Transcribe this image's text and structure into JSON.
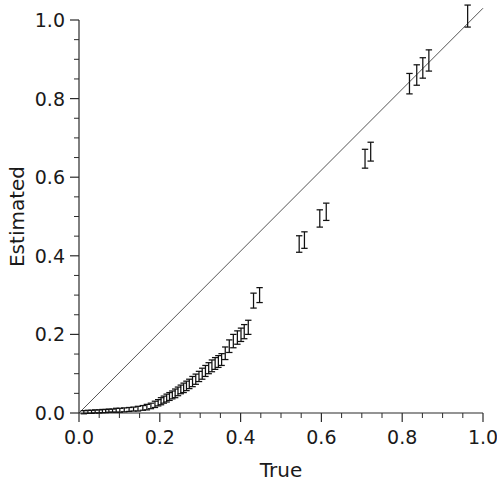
{
  "chart_data": {
    "type": "scatter",
    "title": "",
    "xlabel": "True",
    "ylabel": "Estimated",
    "xlim": [
      0.0,
      1.0
    ],
    "ylim": [
      0.0,
      1.0
    ],
    "grid": false,
    "legend": null,
    "xticks": [
      0.0,
      0.2,
      0.4,
      0.6,
      0.8,
      1.0
    ],
    "yticks": [
      0.0,
      0.2,
      0.4,
      0.6,
      0.8,
      1.0
    ],
    "xticklabels": [
      "0.0",
      "0.2",
      "0.4",
      "0.6",
      "0.8",
      "1.0"
    ],
    "yticklabels": [
      "0.0",
      "0.2",
      "0.4",
      "0.6",
      "0.8",
      "1.0"
    ],
    "minor_tick_step": 0.05,
    "reference_line": {
      "name": "identity-line",
      "from": [
        0.0,
        0.0
      ],
      "to": [
        1.0,
        1.03
      ],
      "color": "#555555"
    },
    "marker_style": "vertical-error-bar-with-caps",
    "marker_color": "#111111",
    "series": [
      {
        "name": "estimated-vs-true",
        "x": [
          0.012,
          0.022,
          0.031,
          0.04,
          0.05,
          0.058,
          0.066,
          0.074,
          0.083,
          0.092,
          0.101,
          0.112,
          0.124,
          0.135,
          0.146,
          0.158,
          0.168,
          0.178,
          0.188,
          0.196,
          0.203,
          0.21,
          0.217,
          0.224,
          0.231,
          0.238,
          0.245,
          0.252,
          0.259,
          0.266,
          0.273,
          0.281,
          0.289,
          0.297,
          0.305,
          0.313,
          0.321,
          0.329,
          0.337,
          0.345,
          0.353,
          0.362,
          0.372,
          0.382,
          0.392,
          0.401,
          0.409,
          0.419,
          0.432,
          0.447,
          0.545,
          0.558,
          0.596,
          0.612,
          0.708,
          0.722,
          0.818,
          0.836,
          0.851,
          0.866,
          0.962
        ],
        "y": [
          0.002,
          0.003,
          0.003,
          0.004,
          0.004,
          0.005,
          0.005,
          0.006,
          0.006,
          0.007,
          0.007,
          0.008,
          0.009,
          0.01,
          0.011,
          0.013,
          0.015,
          0.018,
          0.022,
          0.026,
          0.03,
          0.034,
          0.038,
          0.042,
          0.046,
          0.05,
          0.055,
          0.06,
          0.064,
          0.069,
          0.074,
          0.08,
          0.086,
          0.093,
          0.1,
          0.107,
          0.114,
          0.12,
          0.126,
          0.131,
          0.136,
          0.152,
          0.17,
          0.183,
          0.192,
          0.199,
          0.207,
          0.218,
          0.286,
          0.3,
          0.43,
          0.44,
          0.495,
          0.512,
          0.647,
          0.665,
          0.838,
          0.86,
          0.878,
          0.897,
          1.01
        ],
        "yerr": [
          0.004,
          0.004,
          0.004,
          0.004,
          0.004,
          0.004,
          0.004,
          0.004,
          0.004,
          0.005,
          0.005,
          0.005,
          0.005,
          0.005,
          0.006,
          0.006,
          0.007,
          0.007,
          0.008,
          0.008,
          0.009,
          0.009,
          0.01,
          0.01,
          0.01,
          0.011,
          0.011,
          0.011,
          0.012,
          0.012,
          0.012,
          0.013,
          0.013,
          0.013,
          0.014,
          0.014,
          0.014,
          0.015,
          0.015,
          0.015,
          0.015,
          0.016,
          0.016,
          0.017,
          0.017,
          0.017,
          0.018,
          0.018,
          0.019,
          0.019,
          0.021,
          0.021,
          0.022,
          0.022,
          0.024,
          0.024,
          0.026,
          0.026,
          0.026,
          0.027,
          0.028
        ]
      }
    ]
  }
}
